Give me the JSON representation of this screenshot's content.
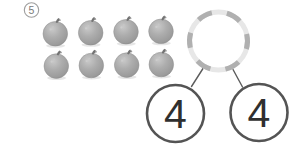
{
  "problem": {
    "number": "5"
  },
  "illustration": {
    "fruit": "orange",
    "fruit_count": 8,
    "rows": 2,
    "per_row": 4,
    "fruit_body_color": "#ababab",
    "fruit_stem_color": "#737373"
  },
  "number_bond": {
    "whole_value": "",
    "parts": [
      {
        "value": "4"
      },
      {
        "value": "4"
      }
    ],
    "colors": {
      "whole_dash": "#b0b0b0",
      "whole_base": "#e7e7e7",
      "part_stroke": "#545454",
      "connector": "#5c5c5c",
      "value_text": "#2f2f2f",
      "badge_stroke": "#9e9e9e",
      "badge_text": "#7a7a7a"
    }
  }
}
